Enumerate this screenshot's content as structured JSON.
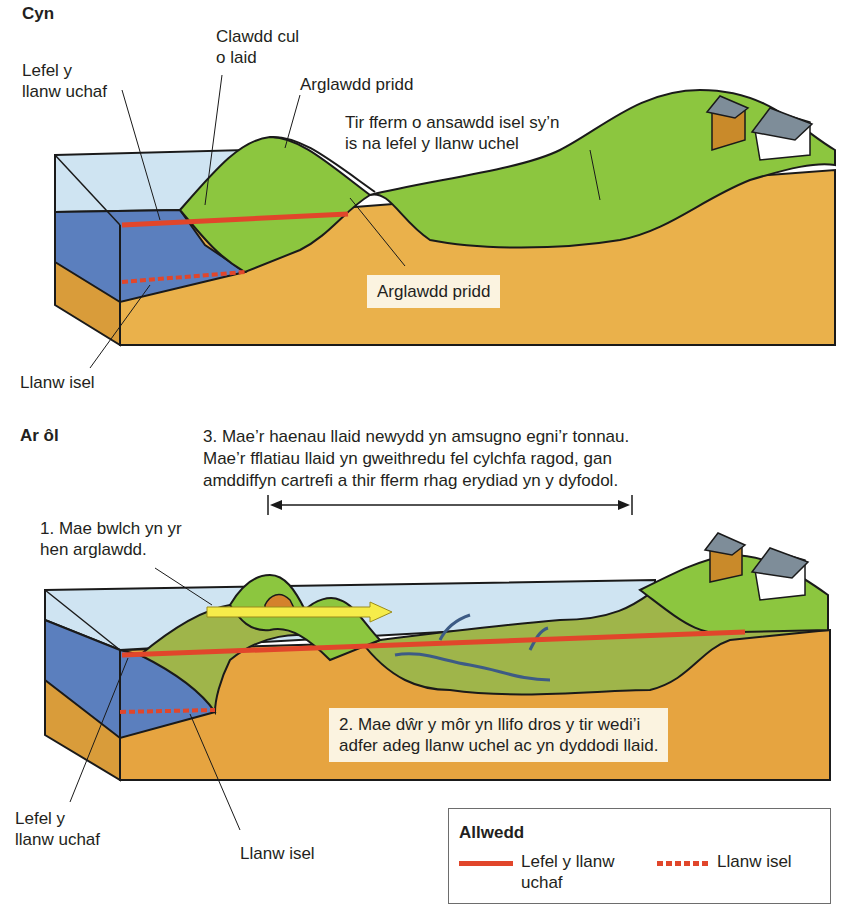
{
  "before": {
    "heading": "Cyn",
    "labels": {
      "high_tide": "Lefel y\nllanw uchaf",
      "mud_bank": "Clawdd cul\no laid",
      "earth_embankment_top": "Arglawdd pridd",
      "farmland": "Tir fferm o ansawdd isel sy’n\nis na lefel y llanw uchel",
      "earth_embankment_box": "Arglawdd pridd",
      "low_tide": "Llanw isel"
    }
  },
  "after": {
    "heading": "Ar ôl",
    "labels": {
      "step3": "3. Mae’r haenau llaid newydd yn amsugno egni’r tonnau.\nMae’r fflatiau llaid yn gweithredu fel cylchfa ragod, gan\namddiffyn cartrefi a thir fferm rhag erydiad yn y dyfodol.",
      "step1": "1. Mae bwlch yn yr\nhen arglawdd.",
      "step2": "2. Mae dŵr y môr yn llifo dros y tir wedi’i\nadfer adeg llanw uchel ac yn dyddodi llaid.",
      "high_tide": "Lefel y\nllanw uchaf",
      "low_tide": "Llanw isel"
    }
  },
  "legend": {
    "title": "Allwedd",
    "items": [
      {
        "style": "solid",
        "label": "Lefel y llanw\nuchaf"
      },
      {
        "style": "dashed",
        "label": "Llanw isel"
      }
    ]
  },
  "colors": {
    "tide_line": "#e1462b",
    "sea_light": "#cfe4f2",
    "sea_dark": "#5b7fbe",
    "grass": "#8cc63f",
    "soil": "#e9b04a",
    "label_box": "#fbf3e0",
    "arrow_yellow": "#f6ec4a"
  }
}
